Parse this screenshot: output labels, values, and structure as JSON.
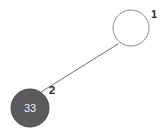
{
  "canvas": {
    "width": 165,
    "height": 133,
    "background_color": "#ffffff"
  },
  "chart_data": {
    "type": "diagram",
    "diagram_kind": "node-link-graph",
    "title": "",
    "nodes": [
      {
        "id": "node-1",
        "label": "1",
        "value_text": "",
        "cx": 131,
        "cy": 28,
        "r": 18,
        "fill": "none",
        "stroke": "#8a8a8a",
        "stroke_width": 1,
        "label_x": 154,
        "label_y": 18,
        "filled": false
      },
      {
        "id": "node-2",
        "label": "2",
        "value_text": "33",
        "cx": 30,
        "cy": 108,
        "r": 19,
        "fill": "#5b5b5b",
        "stroke": "#4a4a4a",
        "stroke_width": 1,
        "label_x": 52,
        "label_y": 94,
        "filled": true
      }
    ],
    "edges": [
      {
        "id": "edge-1-2",
        "from": "node-1",
        "to": "node-2",
        "x1": 118,
        "y1": 44,
        "x2": 41,
        "y2": 92,
        "stroke": "#6f6f6f",
        "stroke_width": 1
      }
    ],
    "labels": [
      "1",
      "2"
    ],
    "node_values": [
      "33"
    ],
    "legend": [],
    "annotations": []
  },
  "colors": {
    "background": "#ffffff",
    "node_outline": "#8a8a8a",
    "node_fill_dark": "#5b5b5b",
    "edge": "#6f6f6f",
    "label_text": "#2b2b2b",
    "value_text": "#f2f2f2"
  }
}
